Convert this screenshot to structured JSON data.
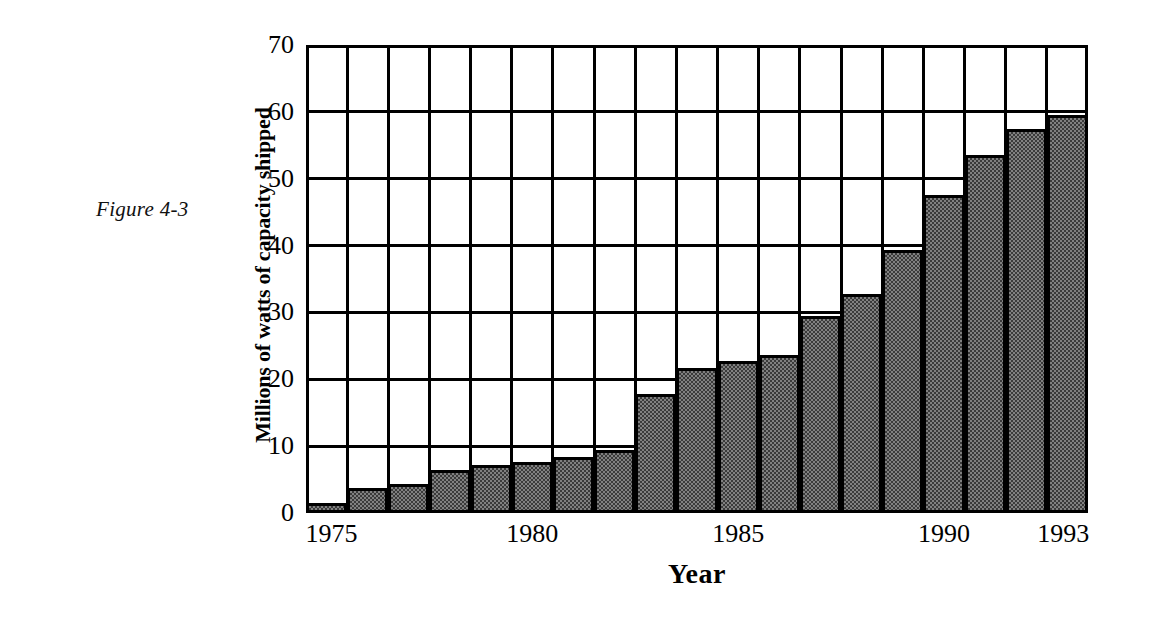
{
  "figure": {
    "caption": "Figure 4-3"
  },
  "chart_data": {
    "type": "bar",
    "title": "",
    "xlabel": "Year",
    "ylabel": "Millions of watts of capacity shipped",
    "ylim": [
      0,
      70
    ],
    "yticks": [
      0,
      10,
      20,
      30,
      40,
      50,
      60,
      70
    ],
    "xtick_labels": [
      "1975",
      "1980",
      "1985",
      "1990",
      "1993"
    ],
    "xtick_categories": [
      "1975",
      "1980",
      "1985",
      "1990",
      "1993"
    ],
    "grid": "both",
    "legend": "none",
    "bar_fill_color": "#808080",
    "bar_edge_color": "#000000",
    "categories": [
      "1975",
      "1976",
      "1977",
      "1978",
      "1979",
      "1980",
      "1981",
      "1982",
      "1983",
      "1984",
      "1985",
      "1986",
      "1987",
      "1988",
      "1989",
      "1990",
      "1991",
      "1992",
      "1993"
    ],
    "values": [
      1.5,
      3.7,
      4.3,
      6.4,
      7.2,
      7.6,
      8.4,
      9.5,
      17.8,
      21.7,
      22.8,
      23.6,
      29.5,
      32.8,
      39.4,
      47.5,
      53.5,
      57.5,
      59.5
    ]
  }
}
